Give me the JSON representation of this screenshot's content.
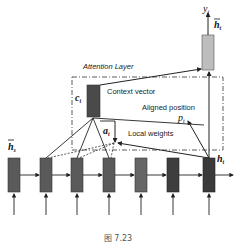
{
  "diagram": {
    "title": "Attention Layer",
    "labels": {
      "output": "y",
      "output_sub": "t",
      "attn_hidden": "h",
      "attn_hidden_sub": "t",
      "context_symbol": "c",
      "context_sub": "t",
      "context_vector": "Context vector",
      "aligned_position": "Aligned position",
      "aligned_symbol": "p",
      "aligned_sub": "t",
      "weights_symbol": "a",
      "weights_sub": "t",
      "local_weights": "Local weights",
      "source_hidden": "h",
      "source_hidden_sub": "s",
      "target_hidden": "h",
      "target_hidden_sub": "t"
    },
    "encoder_cells": 7,
    "colors": {
      "cell_dark": "#555555",
      "cell_darker": "#3a3a3a",
      "context_box": "#4a4a4a",
      "attn_box": "#bdbdbd",
      "line": "#222222"
    }
  },
  "caption": "图 7.23"
}
